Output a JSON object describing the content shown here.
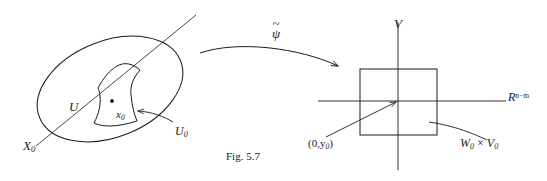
{
  "figure": {
    "caption": "Fig. 5.7",
    "background_color": "#ffffff",
    "ink_color": "#1a1a1a"
  },
  "left_panel": {
    "name": "manifold-domain",
    "outer_region_label": "X",
    "outer_region_label_sub": "0",
    "neighborhood_label": "U",
    "point_label": "x",
    "point_label_sub": "0",
    "inner_region_label": "U",
    "inner_region_label_sub": "0"
  },
  "map_arrow": {
    "name": "psi-tilde-map",
    "symbol": "ψ",
    "accent": "~"
  },
  "right_panel": {
    "name": "euclidean-target",
    "vertical_axis_label": "V",
    "horizontal_axis_label": "R",
    "horizontal_axis_exponent": "n−m",
    "origin_point_label": "(0,y",
    "origin_point_label_sub": "0",
    "origin_point_label_close": ")",
    "box_label_w": "W",
    "box_label_w_sub": "0",
    "box_label_times": "×",
    "box_label_v": "V",
    "box_label_v_sub": "0"
  }
}
